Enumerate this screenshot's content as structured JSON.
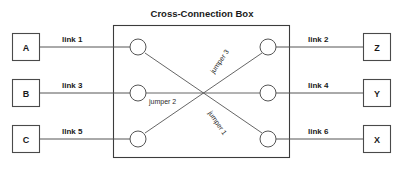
{
  "diagram": {
    "title": "Cross-Connection Box",
    "left_nodes": [
      {
        "label": "A",
        "link_label": "link 1"
      },
      {
        "label": "B",
        "link_label": "link 3"
      },
      {
        "label": "C",
        "link_label": "llnk 5"
      }
    ],
    "right_nodes": [
      {
        "label": "Z",
        "link_label": "link 2"
      },
      {
        "label": "Y",
        "link_label": "link 4"
      },
      {
        "label": "X",
        "link_label": "link 6"
      }
    ],
    "jumpers": [
      {
        "label": "jumper 1",
        "from": "left-bottom-port",
        "to": "right-top-port"
      },
      {
        "label": "jumper 2",
        "from": "left-middle-port",
        "to": "right-middle-port"
      },
      {
        "label": "jumper 3",
        "from": "left-top-port",
        "to": "right-bottom-port"
      }
    ],
    "colors": {
      "stroke": "#555555",
      "box_stroke": "#3c3c3c",
      "text": "#1a1a1a",
      "background": "#ffffff"
    }
  }
}
